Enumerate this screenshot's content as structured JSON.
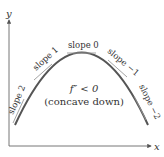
{
  "diagram": {
    "axes": {
      "x_label": "x",
      "y_label": "y"
    },
    "curve": {
      "type": "parabola",
      "concavity": "down",
      "color": "#555555"
    },
    "tangents": [
      {
        "label": "slope 2",
        "slope": 2
      },
      {
        "label": "slope 1",
        "slope": 1
      },
      {
        "label": "slope 0",
        "slope": 0
      },
      {
        "label": "slope −1",
        "slope": -1
      },
      {
        "label": "slope −2",
        "slope": -2
      }
    ],
    "annotation": {
      "condition": "f″ < 0",
      "description": "(concave down)"
    },
    "colors": {
      "axis": "#666666",
      "curve": "#555555",
      "tangent": "#888888",
      "text": "#333333"
    }
  }
}
